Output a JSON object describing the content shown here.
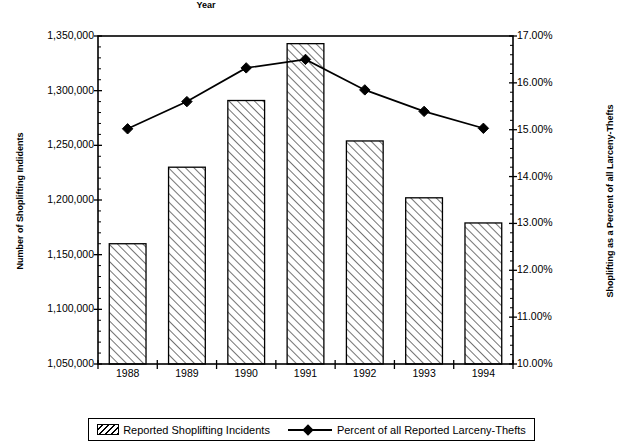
{
  "chart_data": {
    "type": "bar",
    "title": "",
    "categories": [
      "1988",
      "1989",
      "1990",
      "1991",
      "1992",
      "1993",
      "1994"
    ],
    "xlabel": "Year",
    "grid": false,
    "legend_position": "bottom",
    "series": [
      {
        "name": "Reported Shoplifting Incidents",
        "type": "bar",
        "axis": "left",
        "values": [
          1160000,
          1230000,
          1291000,
          1343000,
          1254000,
          1202000,
          1179000
        ]
      },
      {
        "name": "Percent of all Reported Larceny-Thefts",
        "type": "line",
        "axis": "right",
        "values": [
          15.02,
          15.6,
          16.32,
          16.5,
          15.85,
          15.39,
          15.03
        ]
      }
    ],
    "left_axis": {
      "label": "Number of Shoplifting Indidents",
      "min": 1050000,
      "max": 1350000,
      "ticks": [
        1050000,
        1100000,
        1150000,
        1200000,
        1250000,
        1300000,
        1350000
      ],
      "tick_labels": [
        "1,050,000",
        "1,100,000",
        "1,150,000",
        "1,200,000",
        "1,250,000",
        "1,300,000",
        "1,350,000"
      ],
      "minor_ticks_per_interval": 5
    },
    "right_axis": {
      "label": "Shoplifting as a Percent of all Larceny-Thefts",
      "min": 10.0,
      "max": 17.0,
      "ticks": [
        10.0,
        11.0,
        12.0,
        13.0,
        14.0,
        15.0,
        16.0,
        17.0
      ],
      "tick_labels": [
        "10.00%",
        "11.00%",
        "12.00%",
        "13.00%",
        "14.00%",
        "15.00%",
        "16.00%",
        "17.00%"
      ],
      "minor_ticks_per_interval": 5
    },
    "legend": [
      {
        "label": "Reported Shoplifting Incidents",
        "marker": "hatched-bar"
      },
      {
        "label": "Percent of all Reported Larceny-Thefts",
        "marker": "line-diamond"
      }
    ],
    "colors": {
      "foreground": "#000000",
      "background": "#ffffff",
      "bar_fill": "#ffffff",
      "bar_hatch": "#000000",
      "line": "#000000"
    }
  }
}
